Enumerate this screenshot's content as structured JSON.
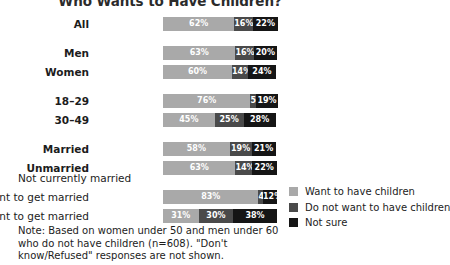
{
  "title": "Who Wants to Have Children?",
  "group_header": "Not currently married",
  "legend": {
    "items": [
      {
        "label": "Want to have children",
        "color": "#a9a9a9"
      },
      {
        "label": "Do not want to have children",
        "color": "#4a4a4a"
      },
      {
        "label": "Not sure",
        "color": "#151515"
      }
    ]
  },
  "footnote": "Note: Based on women under 50 and men under 60 who do not have children (n=608). \"Don't know/Refused\" responses are not shown.",
  "chart_data": {
    "type": "bar",
    "orientation": "horizontal",
    "stacked": true,
    "title": "Who Wants to Have Children?",
    "xlabel": "",
    "ylabel": "",
    "xlim": [
      0,
      100
    ],
    "grid": false,
    "legend_position": "right-bottom",
    "value_suffix": "%",
    "categories": [
      "All",
      "Men",
      "Women",
      "18–29",
      "30–49",
      "Married",
      "Unmarried",
      "Want to get married",
      "Do not want to get married"
    ],
    "series": [
      {
        "name": "Want to have children",
        "color": "#a9a9a9",
        "values": [
          62,
          63,
          60,
          76,
          45,
          58,
          63,
          83,
          31
        ]
      },
      {
        "name": "Do not want to have children",
        "color": "#4a4a4a",
        "values": [
          16,
          16,
          14,
          5,
          25,
          19,
          14,
          4,
          30
        ]
      },
      {
        "name": "Not sure",
        "color": "#151515",
        "values": [
          22,
          20,
          24,
          19,
          28,
          21,
          22,
          12,
          38
        ]
      }
    ],
    "rows": [
      {
        "label": "All",
        "group": 0,
        "indented": false,
        "values": [
          62,
          16,
          22
        ],
        "value_labels": [
          "62%",
          "16%",
          "22%"
        ]
      },
      {
        "label": "Men",
        "group": 1,
        "indented": false,
        "values": [
          63,
          16,
          20
        ],
        "value_labels": [
          "63%",
          "16%",
          "20%"
        ]
      },
      {
        "label": "Women",
        "group": 1,
        "indented": false,
        "values": [
          60,
          14,
          24
        ],
        "value_labels": [
          "60%",
          "14%",
          "24%"
        ]
      },
      {
        "label": "18–29",
        "group": 2,
        "indented": false,
        "values": [
          76,
          5,
          19
        ],
        "value_labels": [
          "76%",
          "5%",
          "19%"
        ]
      },
      {
        "label": "30–49",
        "group": 2,
        "indented": false,
        "values": [
          45,
          25,
          28
        ],
        "value_labels": [
          "45%",
          "25%",
          "28%"
        ]
      },
      {
        "label": "Married",
        "group": 3,
        "indented": false,
        "values": [
          58,
          19,
          21
        ],
        "value_labels": [
          "58%",
          "19%",
          "21%"
        ]
      },
      {
        "label": "Unmarried",
        "group": 3,
        "indented": false,
        "values": [
          63,
          14,
          22
        ],
        "value_labels": [
          "63%",
          "14%",
          "22%"
        ]
      },
      {
        "label": "Want to get married",
        "group": 4,
        "indented": true,
        "values": [
          83,
          4,
          12
        ],
        "value_labels": [
          "83%",
          "4%",
          "12%"
        ]
      },
      {
        "label": "Do not want to get married",
        "group": 4,
        "indented": true,
        "values": [
          31,
          30,
          38
        ],
        "value_labels": [
          "31%",
          "30%",
          "38%"
        ]
      }
    ]
  }
}
